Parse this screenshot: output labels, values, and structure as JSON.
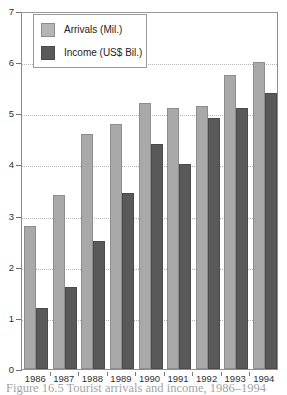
{
  "chart_data": {
    "type": "bar",
    "title": "",
    "xlabel": "",
    "ylabel": "",
    "ylim": [
      0,
      7
    ],
    "yticks": [
      0,
      1,
      2,
      3,
      4,
      5,
      6,
      7
    ],
    "grid": true,
    "grid_style": "dotted horizontal",
    "legend_position": "top-left inside plot",
    "categories": [
      "1986",
      "1987",
      "1988",
      "1989",
      "1990",
      "1991",
      "1992",
      "1993",
      "1994"
    ],
    "series": [
      {
        "name": "Arrivals (Mil.)",
        "color": "#a9a9a9",
        "values": [
          2.8,
          3.4,
          4.6,
          4.8,
          5.2,
          5.1,
          5.15,
          5.75,
          6.0
        ]
      },
      {
        "name": "Income (US$ Bil.)",
        "color": "#595959",
        "values": [
          1.2,
          1.6,
          2.5,
          3.45,
          4.4,
          4.0,
          4.9,
          5.1,
          5.4
        ]
      }
    ]
  },
  "legend": {
    "items": [
      {
        "label": "Arrivals (Mil.)",
        "swatch": "arrivals"
      },
      {
        "label": "Income (US$ Bil.)",
        "swatch": "income"
      }
    ]
  },
  "caption": {
    "text": "Figure 16.5  Tourist arrivals and income, 1986–1994"
  },
  "colors": {
    "arrivals": "#a9a9a9",
    "income": "#595959",
    "frame": "#8e8e8e",
    "gridline": "#b4b4b4"
  }
}
